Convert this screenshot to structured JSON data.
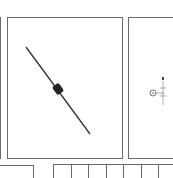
{
  "document": {
    "figure": {
      "component": "axial-lead diode",
      "polarity_mark": "cathode band"
    },
    "side_diagram": {
      "symbol": "circle-with-dot",
      "dimension_marker": "B"
    },
    "table": {
      "cells": [
        "",
        "",
        "",
        "",
        "",
        "",
        ""
      ]
    }
  }
}
